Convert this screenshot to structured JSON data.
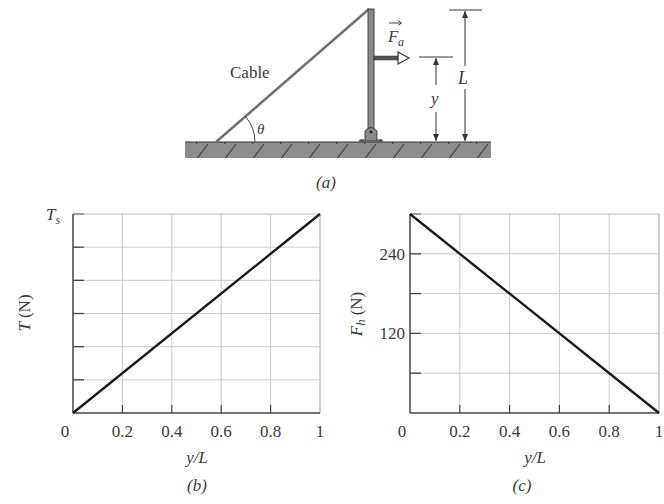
{
  "figure": {
    "diagram": {
      "caption": "(a)",
      "cable_label": "Cable",
      "angle_label": "θ",
      "force_label": "F",
      "force_subscript": "a",
      "height_label": "y",
      "length_label": "L"
    }
  },
  "chart_data": [
    {
      "type": "line",
      "panel": "(b)",
      "caption": "(b)",
      "xlabel": "y/L",
      "ylabel": "T (N)",
      "ylabel_main": "T",
      "ylabel_unit": "(N)",
      "xlim": [
        0,
        1
      ],
      "ylim": [
        0,
        1
      ],
      "y_units_note": "T_s",
      "x_ticks": [
        0,
        0.2,
        0.4,
        0.6,
        0.8,
        1
      ],
      "x_tick_labels": [
        "0",
        "0.2",
        "0.4",
        "0.6",
        "0.8",
        "1"
      ],
      "y_gridlines": 6,
      "y_tick_labels": [
        {
          "value": 1,
          "label": "Ts"
        }
      ],
      "grid": true,
      "series": [
        {
          "name": "T",
          "x": [
            0,
            1
          ],
          "y": [
            0,
            1
          ]
        }
      ]
    },
    {
      "type": "line",
      "panel": "(c)",
      "caption": "(c)",
      "xlabel": "y/L",
      "ylabel": "Fh (N)",
      "ylabel_main": "F",
      "ylabel_sub": "h",
      "ylabel_unit": "(N)",
      "xlim": [
        0,
        1
      ],
      "ylim": [
        0,
        300
      ],
      "x_ticks": [
        0,
        0.2,
        0.4,
        0.6,
        0.8,
        1
      ],
      "x_tick_labels": [
        "0",
        "0.2",
        "0.4",
        "0.6",
        "0.8",
        "1"
      ],
      "y_ticks": [
        0,
        60,
        120,
        180,
        240,
        300
      ],
      "y_tick_labels": [
        {
          "value": 120,
          "label": "120"
        },
        {
          "value": 240,
          "label": "240"
        }
      ],
      "grid": true,
      "series": [
        {
          "name": "Fh",
          "x": [
            0,
            1
          ],
          "y": [
            300,
            0
          ]
        }
      ]
    }
  ]
}
